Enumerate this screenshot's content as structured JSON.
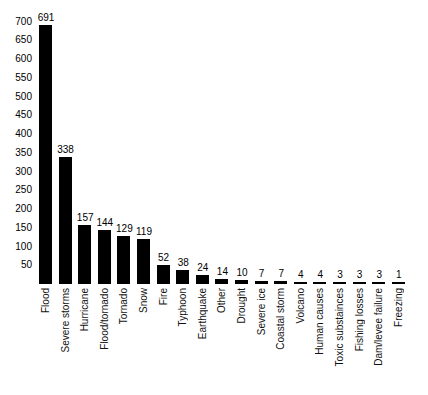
{
  "chart_data": {
    "type": "bar",
    "title": "",
    "subtitle": "",
    "xlabel": "",
    "ylabel": "",
    "ylim": [
      0,
      720
    ],
    "grid": false,
    "legend": null,
    "orientation": "vertical",
    "bar_color": "#000000",
    "background_color": "#ffffff",
    "y_ticks": [
      50,
      100,
      150,
      200,
      250,
      300,
      350,
      400,
      450,
      500,
      550,
      600,
      650,
      700
    ],
    "categories": [
      "Flood",
      "Severe storms",
      "Hurricane",
      "Flood/tornado",
      "Tornado",
      "Snow",
      "Fire",
      "Typhoon",
      "Earthquake",
      "Other",
      "Drought",
      "Severe ice",
      "Coastal storm",
      "Volcano",
      "Human causes",
      "Toxic substainces",
      "Fishing losses",
      "Dam/levee failure",
      "Freezing"
    ],
    "values": [
      691,
      338,
      157,
      144,
      129,
      119,
      52,
      38,
      24,
      14,
      10,
      7,
      7,
      4,
      4,
      3,
      3,
      3,
      1
    ],
    "data_labels": [
      "691",
      "338",
      "157",
      "144",
      "129",
      "119",
      "52",
      "38",
      "24",
      "14",
      "10",
      "7",
      "7",
      "4",
      "4",
      "3",
      "3",
      "3",
      "1"
    ]
  }
}
